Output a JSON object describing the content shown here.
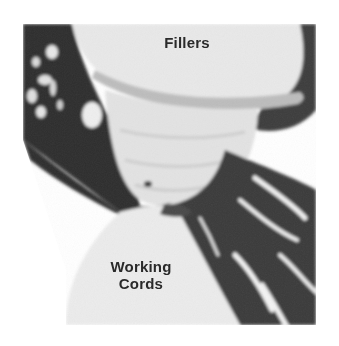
{
  "image": {
    "subject": "macrame knot photograph (grayscale)",
    "tone": "grayscale",
    "colors": {
      "background": "#ffffff",
      "dark_cords": "#3a3a3a",
      "light_cords": "#e6e6e6",
      "mid_tone": "#c9c9c9",
      "label_text": "#2a2a2a"
    }
  },
  "labels": {
    "fillers": "Fillers",
    "working_line1": "Working",
    "working_line2": "Cords"
  }
}
